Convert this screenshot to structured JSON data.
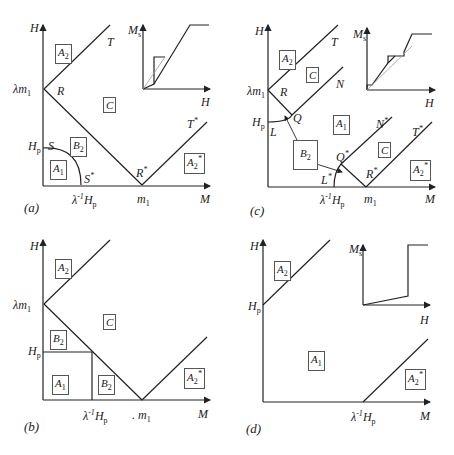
{
  "panels": {
    "a": {
      "caption": "(a)",
      "axes": {
        "x": "M",
        "y": "H"
      },
      "ticks": {
        "lambda_m1": "λm",
        "lambda_m1_sub": "1",
        "Hp": "H",
        "Hp_sub": "p",
        "inv_Hp_pre": "λ",
        "inv_Hp_sup": "-1",
        "inv_Hp": "H",
        "inv_Hp_sub": "p",
        "m1": "m",
        "m1_sub": "1"
      },
      "points": {
        "T": "T",
        "R": "R",
        "S": "S",
        "S_star": "S",
        "R_star": "R",
        "T_star": "T",
        "star": "*"
      },
      "regions": {
        "A2": "A",
        "A2_sub": "2",
        "C": "C",
        "B2": "B",
        "B2_sub": "2",
        "A1": "A",
        "A1_sub": "1",
        "A2s": "A",
        "A2s_sub": "2",
        "star": "*"
      },
      "inset": {
        "y": "M",
        "y_sub": "s",
        "x": "H"
      }
    },
    "b": {
      "caption": "(b)",
      "axes": {
        "x": "M",
        "y": "H"
      },
      "ticks": {
        "lambda_m1": "λm",
        "lambda_m1_sub": "1",
        "Hp": "H",
        "Hp_sub": "p",
        "inv_Hp_pre": "λ",
        "inv_Hp_sup": "-1",
        "inv_Hp": "H",
        "inv_Hp_sub": "p",
        "m1": ". m",
        "m1_sub": "1"
      },
      "regions": {
        "A2": "A",
        "A2_sub": "2",
        "C": "C",
        "B2_top": "B",
        "B2_right": "B",
        "B2_sub": "2",
        "A1": "A",
        "A1_sub": "1",
        "A2s": "A",
        "A2s_sub": "2",
        "star": "*"
      }
    },
    "c": {
      "caption": "(c)",
      "axes": {
        "x": "M",
        "y": "H"
      },
      "ticks": {
        "lambda_m1": "λm",
        "lambda_m1_sub": "1",
        "Hp": "H",
        "Hp_sub": "p",
        "inv_Hp_pre": "λ",
        "inv_Hp_sup": "-1",
        "inv_Hp": "H",
        "inv_Hp_sub": "p",
        "m1": "m",
        "m1_sub": "1"
      },
      "points": {
        "T": "T",
        "R": "R",
        "N": "N",
        "Q": "Q",
        "L": "L",
        "N_star": "N",
        "Q_star": "Q",
        "L_star": "L",
        "R_star": "R",
        "T_star": "T",
        "star": "*"
      },
      "regions": {
        "A2": "A",
        "A2_sub": "2",
        "C_top": "C",
        "A1": "A",
        "A1_sub": "1",
        "B2": "B",
        "B2_sub": "2",
        "C_bottom": "C",
        "A2s": "A",
        "A2s_sub": "2",
        "star": "*"
      },
      "inset": {
        "y": "M",
        "y_sub": "s",
        "x": "H"
      }
    },
    "d": {
      "caption": "(d)",
      "axes": {
        "x": "M",
        "y": "H"
      },
      "ticks": {
        "Hp": "H",
        "Hp_sub": "p",
        "inv_Hp_pre": "λ",
        "inv_Hp_sup": "-1",
        "inv_Hp": "H",
        "inv_Hp_sub": "p"
      },
      "regions": {
        "A2": "A",
        "A2_sub": "2",
        "A1": "A",
        "A1_sub": "1",
        "A2s": "A",
        "A2s_sub": "2",
        "star": "*"
      },
      "inset": {
        "y": "M",
        "y_sub": "s",
        "x": "H"
      }
    }
  },
  "colors": {
    "line": "#222222",
    "thin": "#888888"
  }
}
